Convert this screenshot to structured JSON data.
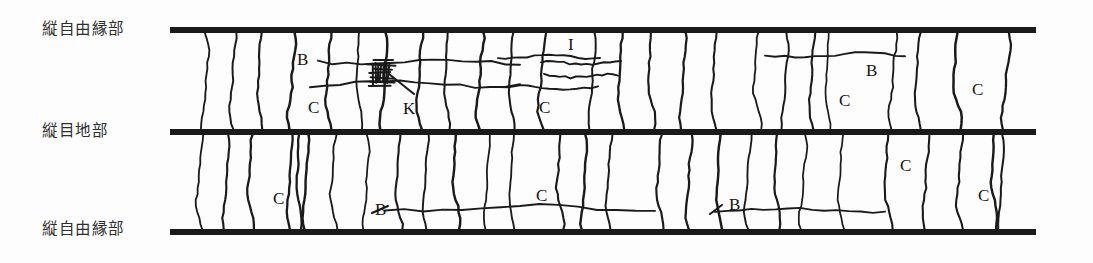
{
  "figure": {
    "width": 1093,
    "height": 263,
    "background_color": "#fdfdfd",
    "ink_color": "#1a1a1a",
    "label_color": "#2e2e2e"
  },
  "zone_labels": [
    {
      "name": "top-free-edge-label",
      "text": "縦自由縁部",
      "x": 42,
      "y": 22
    },
    {
      "name": "middle-joint-label",
      "text": "縦目地部",
      "x": 42,
      "y": 124
    },
    {
      "name": "bottom-free-edge-label",
      "text": "縦自由縁部",
      "x": 42,
      "y": 222
    }
  ],
  "boundaries": [
    {
      "name": "top-boundary-line",
      "y": 30,
      "x1": 170,
      "x2": 1036,
      "thickness": 6
    },
    {
      "name": "middle-boundary-line",
      "y": 132,
      "x1": 170,
      "x2": 1036,
      "thickness": 6
    },
    {
      "name": "bottom-boundary-line",
      "y": 232,
      "x1": 170,
      "x2": 1036,
      "thickness": 6
    }
  ],
  "bands": [
    {
      "name": "upper-band",
      "top": 30,
      "bottom": 132
    },
    {
      "name": "lower-band",
      "top": 132,
      "bottom": 232
    }
  ],
  "defect_codes": [
    {
      "name": "defect-code-b-1",
      "text": "B",
      "x": 297,
      "y": 51,
      "band": "upper"
    },
    {
      "name": "defect-code-c-1",
      "text": "C",
      "x": 308,
      "y": 99,
      "band": "upper"
    },
    {
      "name": "defect-code-k-1",
      "text": "K",
      "x": 403,
      "y": 100,
      "band": "upper"
    },
    {
      "name": "defect-code-i-1",
      "text": "I",
      "x": 568,
      "y": 36,
      "band": "upper"
    },
    {
      "name": "defect-code-c-2",
      "text": "C",
      "x": 539,
      "y": 99,
      "band": "upper"
    },
    {
      "name": "defect-code-b-2",
      "text": "B",
      "x": 866,
      "y": 62,
      "band": "upper"
    },
    {
      "name": "defect-code-c-3",
      "text": "C",
      "x": 839,
      "y": 92,
      "band": "upper"
    },
    {
      "name": "defect-code-c-4",
      "text": "C",
      "x": 972,
      "y": 81,
      "band": "upper"
    },
    {
      "name": "defect-code-c-5",
      "text": "C",
      "x": 273,
      "y": 190,
      "band": "lower"
    },
    {
      "name": "defect-code-b-3",
      "text": "B",
      "x": 375,
      "y": 201,
      "band": "lower"
    },
    {
      "name": "defect-code-c-6",
      "text": "C",
      "x": 536,
      "y": 187,
      "band": "lower"
    },
    {
      "name": "defect-code-b-4",
      "text": "B",
      "x": 729,
      "y": 196,
      "band": "lower"
    },
    {
      "name": "defect-code-c-7",
      "text": "C",
      "x": 900,
      "y": 157,
      "band": "lower"
    },
    {
      "name": "defect-code-c-8",
      "text": "C",
      "x": 978,
      "y": 187,
      "band": "lower"
    }
  ],
  "grain_lines_upper": [
    {
      "name": "grain-line",
      "x": 205,
      "amp": 3.0,
      "phase": 0.0
    },
    {
      "name": "grain-line",
      "x": 233,
      "amp": 2.6,
      "phase": 1.1
    },
    {
      "name": "grain-line",
      "x": 260,
      "amp": 2.2,
      "phase": 2.0
    },
    {
      "name": "grain-line",
      "x": 292,
      "amp": 3.4,
      "phase": 0.6
    },
    {
      "name": "grain-line",
      "x": 329,
      "amp": 2.8,
      "phase": 1.7
    },
    {
      "name": "grain-line",
      "x": 359,
      "amp": 2.4,
      "phase": 2.6
    },
    {
      "name": "grain-line",
      "x": 384,
      "amp": 3.2,
      "phase": 0.3
    },
    {
      "name": "grain-line",
      "x": 420,
      "amp": 2.7,
      "phase": 1.4
    },
    {
      "name": "grain-line",
      "x": 447,
      "amp": 2.3,
      "phase": 2.3
    },
    {
      "name": "grain-line",
      "x": 480,
      "amp": 3.1,
      "phase": 0.9
    },
    {
      "name": "grain-line",
      "x": 512,
      "amp": 2.5,
      "phase": 2.1
    },
    {
      "name": "grain-line",
      "x": 542,
      "amp": 3.3,
      "phase": 1.2
    },
    {
      "name": "grain-line",
      "x": 592,
      "amp": 2.9,
      "phase": 0.4
    },
    {
      "name": "grain-line",
      "x": 621,
      "amp": 2.4,
      "phase": 1.9
    },
    {
      "name": "grain-line",
      "x": 651,
      "amp": 3.0,
      "phase": 2.8
    },
    {
      "name": "grain-line",
      "x": 683,
      "amp": 2.6,
      "phase": 0.7
    },
    {
      "name": "grain-line",
      "x": 714,
      "amp": 2.2,
      "phase": 1.6
    },
    {
      "name": "grain-line",
      "x": 757,
      "amp": 3.2,
      "phase": 2.4
    },
    {
      "name": "grain-line",
      "x": 785,
      "amp": 2.7,
      "phase": 0.2
    },
    {
      "name": "grain-line",
      "x": 812,
      "amp": 2.3,
      "phase": 1.3
    },
    {
      "name": "grain-line",
      "x": 828,
      "amp": 2.0,
      "phase": 2.2
    },
    {
      "name": "grain-line",
      "x": 893,
      "amp": 3.1,
      "phase": 0.8
    },
    {
      "name": "grain-line",
      "x": 918,
      "amp": 2.5,
      "phase": 1.8
    },
    {
      "name": "grain-line",
      "x": 957,
      "amp": 3.4,
      "phase": 2.7
    },
    {
      "name": "grain-line",
      "x": 1006,
      "amp": 3.6,
      "phase": 0.5
    }
  ],
  "grain_lines_lower": [
    {
      "name": "grain-line",
      "x": 200,
      "amp": 3.0,
      "phase": 1.5
    },
    {
      "name": "grain-line",
      "x": 226,
      "amp": 2.5,
      "phase": 0.4
    },
    {
      "name": "grain-line",
      "x": 251,
      "amp": 2.8,
      "phase": 2.3
    },
    {
      "name": "grain-line",
      "x": 290,
      "amp": 2.2,
      "phase": 1.0
    },
    {
      "name": "grain-line",
      "x": 299,
      "amp": 2.0,
      "phase": 2.6
    },
    {
      "name": "grain-line",
      "x": 306,
      "amp": 2.4,
      "phase": 0.7
    },
    {
      "name": "grain-line",
      "x": 334,
      "amp": 3.2,
      "phase": 1.9
    },
    {
      "name": "grain-line",
      "x": 366,
      "amp": 2.6,
      "phase": 0.1
    },
    {
      "name": "grain-line",
      "x": 399,
      "amp": 3.0,
      "phase": 2.1
    },
    {
      "name": "grain-line",
      "x": 426,
      "amp": 2.3,
      "phase": 1.2
    },
    {
      "name": "grain-line",
      "x": 456,
      "amp": 2.9,
      "phase": 2.8
    },
    {
      "name": "grain-line",
      "x": 487,
      "amp": 2.5,
      "phase": 0.6
    },
    {
      "name": "grain-line",
      "x": 512,
      "amp": 2.1,
      "phase": 1.7
    },
    {
      "name": "grain-line",
      "x": 560,
      "amp": 3.1,
      "phase": 2.5
    },
    {
      "name": "grain-line",
      "x": 584,
      "amp": 2.4,
      "phase": 0.3
    },
    {
      "name": "grain-line",
      "x": 609,
      "amp": 2.7,
      "phase": 1.4
    },
    {
      "name": "grain-line",
      "x": 660,
      "amp": 3.0,
      "phase": 2.2
    },
    {
      "name": "grain-line",
      "x": 689,
      "amp": 2.6,
      "phase": 0.9
    },
    {
      "name": "grain-line",
      "x": 719,
      "amp": 2.2,
      "phase": 2.0
    },
    {
      "name": "grain-line",
      "x": 748,
      "amp": 2.8,
      "phase": 1.1
    },
    {
      "name": "grain-line",
      "x": 777,
      "amp": 2.4,
      "phase": 2.7
    },
    {
      "name": "grain-line",
      "x": 803,
      "amp": 3.0,
      "phase": 0.5
    },
    {
      "name": "grain-line",
      "x": 841,
      "amp": 2.6,
      "phase": 1.8
    },
    {
      "name": "grain-line",
      "x": 888,
      "amp": 3.3,
      "phase": 2.4
    },
    {
      "name": "grain-line",
      "x": 926,
      "amp": 2.7,
      "phase": 0.8
    },
    {
      "name": "grain-line",
      "x": 960,
      "amp": 3.0,
      "phase": 1.6
    },
    {
      "name": "grain-line",
      "x": 994,
      "amp": 2.5,
      "phase": 2.9
    },
    {
      "name": "grain-line",
      "x": 1001,
      "amp": 2.2,
      "phase": 0.2
    }
  ],
  "cracks": [
    {
      "name": "crack-line-b-upper-left",
      "x1": 318,
      "x2": 520,
      "y": 62,
      "wobble": 2.2
    },
    {
      "name": "crack-line-b-upper-mid",
      "x1": 498,
      "x2": 600,
      "y": 57,
      "wobble": 1.6
    },
    {
      "name": "crack-line-c-upper-left",
      "x1": 310,
      "x2": 520,
      "y": 84,
      "wobble": 2.4
    },
    {
      "name": "crack-line-k-upper-right",
      "x1": 500,
      "x2": 598,
      "y": 88,
      "wobble": 1.8
    },
    {
      "name": "crack-line-i-upper-1",
      "x1": 541,
      "x2": 621,
      "y": 63,
      "wobble": 1.5
    },
    {
      "name": "crack-line-i-upper-2",
      "x1": 544,
      "x2": 618,
      "y": 76,
      "wobble": 1.5
    },
    {
      "name": "crack-line-b-upper-far",
      "x1": 765,
      "x2": 905,
      "y": 55,
      "wobble": 2.0
    },
    {
      "name": "crack-line-b-lower-long",
      "x1": 385,
      "x2": 655,
      "y": 208,
      "wobble": 2.6
    },
    {
      "name": "crack-line-b-lower-right",
      "x1": 715,
      "x2": 885,
      "y": 210,
      "wobble": 2.2
    }
  ],
  "leader_lines": [
    {
      "name": "leader-line-k",
      "x1": 414,
      "y1": 94,
      "x2": 389,
      "y2": 74
    },
    {
      "name": "leader-line-b-lower-1",
      "x1": 388,
      "y1": 206,
      "x2": 372,
      "y2": 213
    },
    {
      "name": "leader-line-b-lower-2",
      "x1": 722,
      "y1": 205,
      "x2": 710,
      "y2": 214
    }
  ],
  "knot": {
    "name": "knot-cluster",
    "cx": 381,
    "cy": 73,
    "width": 30,
    "height": 26,
    "hatch_count": 7
  }
}
